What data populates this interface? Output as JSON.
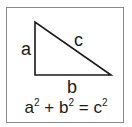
{
  "diagram": {
    "labels": {
      "a": "a",
      "b": "b",
      "c": "c"
    },
    "equation": {
      "term1_base": "a",
      "term1_exp": "2",
      "plus": "+",
      "term2_base": "b",
      "term2_exp": "2",
      "equals": "=",
      "term3_base": "c",
      "term3_exp": "2"
    },
    "colors": {
      "stroke": "#1a1a1a",
      "frame": "#8a8a8a",
      "background": "#ffffff"
    }
  }
}
